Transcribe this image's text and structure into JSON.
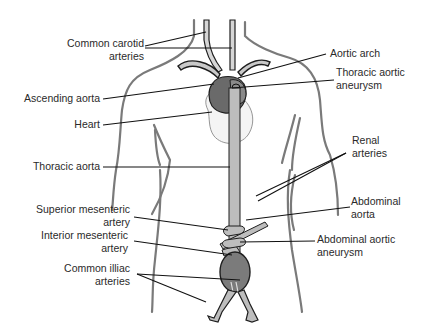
{
  "colors": {
    "background": "#ffffff",
    "outline": "#1e1e1e",
    "body_outline": "#7a7a7a",
    "vessel_fill": "#bdbdbd",
    "aneurysm_fill": "#7b7b7b",
    "heart_fill": "#6a6a6a",
    "leader_line": "#111111",
    "text": "#2a2a2a"
  },
  "labels": {
    "left": [
      {
        "id": "common-carotid-arteries",
        "line1": "Common carotid",
        "line2": "arteries"
      },
      {
        "id": "ascending-aorta",
        "line1": "Ascending aorta",
        "line2": ""
      },
      {
        "id": "heart",
        "line1": "Heart",
        "line2": ""
      },
      {
        "id": "thoracic-aorta",
        "line1": "Thoracic aorta",
        "line2": ""
      },
      {
        "id": "superior-mesenteric-artery",
        "line1": "Superior mesenteric",
        "line2": "artery"
      },
      {
        "id": "interior-mesenteric-artery",
        "line1": "Interior mesenteric",
        "line2": "artery"
      },
      {
        "id": "common-illiac-arteries",
        "line1": "Common illiac",
        "line2": "arteries"
      }
    ],
    "right": [
      {
        "id": "aortic-arch",
        "line1": "Aortic arch",
        "line2": ""
      },
      {
        "id": "thoracic-aortic-aneurysm",
        "line1": "Thoracic aortic",
        "line2": "aneurysm"
      },
      {
        "id": "renal-arteries",
        "line1": "Renal",
        "line2": "arteries"
      },
      {
        "id": "abdominal-aorta",
        "line1": "Abdominal",
        "line2": "aorta"
      },
      {
        "id": "abdominal-aortic-aneurysm",
        "line1": "Abdominal aortic",
        "line2": "aneurysm"
      }
    ]
  }
}
